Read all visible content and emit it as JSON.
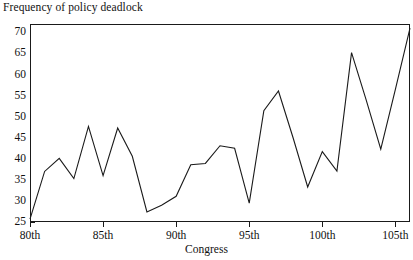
{
  "chart_data": {
    "type": "line",
    "title": "Frequency of policy deadlock",
    "xlabel": "Congress",
    "ylabel": "",
    "xlim": [
      80,
      106
    ],
    "ylim": [
      25,
      72
    ],
    "grid": false,
    "legend": null,
    "x_tick_labels": [
      "80th",
      "85th",
      "90th",
      "95th",
      "100th",
      "105th"
    ],
    "x_tick_values": [
      80,
      85,
      90,
      95,
      100,
      105
    ],
    "y_tick_labels": [
      "25",
      "30",
      "35",
      "40",
      "45",
      "50",
      "55",
      "60",
      "65",
      "70"
    ],
    "y_tick_values": [
      25,
      30,
      35,
      40,
      45,
      50,
      55,
      60,
      65,
      70
    ],
    "x": [
      80,
      81,
      82,
      83,
      84,
      85,
      86,
      87,
      88,
      89,
      90,
      91,
      92,
      93,
      94,
      95,
      96,
      97,
      98,
      99,
      100,
      101,
      102,
      103,
      104,
      105,
      106
    ],
    "values": [
      25.7,
      37.0,
      40.1,
      35.3,
      47.7,
      36.0,
      47.3,
      40.6,
      27.4,
      29.0,
      31.1,
      38.6,
      38.9,
      43.1,
      42.5,
      29.5,
      51.4,
      56.1,
      45.0,
      33.3,
      41.7,
      37.1,
      65.2,
      54.0,
      42.3,
      56.5,
      71.0
    ],
    "series": [
      {
        "name": "Frequency of policy deadlock",
        "values": [
          25.7,
          37.0,
          40.1,
          35.3,
          47.7,
          36.0,
          47.3,
          40.6,
          27.4,
          29.0,
          31.1,
          38.6,
          38.9,
          43.1,
          42.5,
          29.5,
          51.4,
          56.1,
          45.0,
          33.3,
          41.7,
          37.1,
          65.2,
          54.0,
          42.3,
          56.5,
          71.0
        ],
        "color": "#1a1a1a"
      }
    ],
    "line_color": "#1a1a1a",
    "axis_color": "#1a1a1a",
    "background": "#ffffff"
  }
}
